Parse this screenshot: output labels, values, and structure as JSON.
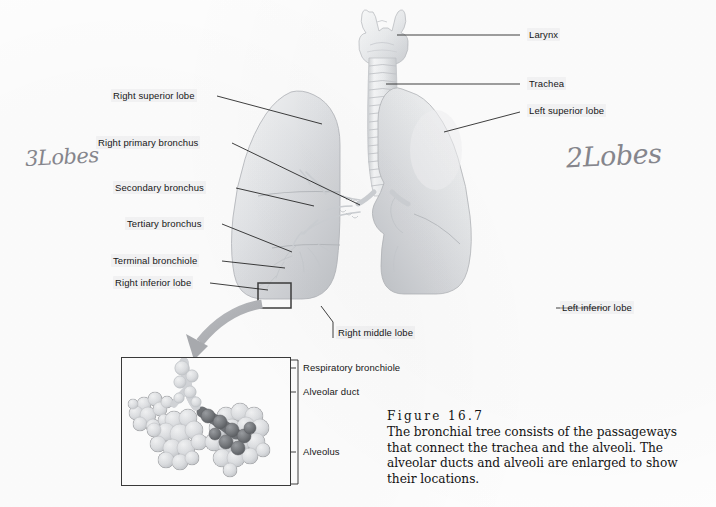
{
  "figure": {
    "number_label": "Figure 16.7",
    "caption": "The bronchial tree consists of the passageways that connect the trachea and the alveoli. The alveolar ducts and alveoli are enlarged to show their locations."
  },
  "labels_left": [
    {
      "name": "right-superior-lobe",
      "text": "Right superior lobe"
    },
    {
      "name": "right-primary-bronchus",
      "text": "Right primary bronchus"
    },
    {
      "name": "secondary-bronchus",
      "text": "Secondary bronchus"
    },
    {
      "name": "tertiary-bronchus",
      "text": "Tertiary bronchus"
    },
    {
      "name": "terminal-bronchiole",
      "text": "Terminal bronchiole"
    },
    {
      "name": "right-inferior-lobe",
      "text": "Right inferior lobe"
    }
  ],
  "labels_right": [
    {
      "name": "larynx",
      "text": "Larynx"
    },
    {
      "name": "trachea",
      "text": "Trachea"
    },
    {
      "name": "left-superior-lobe",
      "text": "Left superior lobe"
    },
    {
      "name": "left-inferior-lobe",
      "text": "Left inferior lobe"
    }
  ],
  "labels_other": [
    {
      "name": "right-middle-lobe",
      "text": "Right middle lobe"
    }
  ],
  "labels_inset": [
    {
      "name": "respiratory-bronchiole",
      "text": "Respiratory bronchiole"
    },
    {
      "name": "alveolar-duct",
      "text": "Alveolar duct"
    },
    {
      "name": "alveolus",
      "text": "Alveolus"
    }
  ],
  "annotations": [
    {
      "name": "handwriting-three-lobes",
      "text": "3Lobes"
    },
    {
      "name": "handwriting-two-lobes",
      "text": "2Lobes"
    }
  ],
  "colors": {
    "page_background": "#fdfdfd",
    "label_text": "#171717",
    "leader_line": "#1d1d1d",
    "handwriting": "#6e6e76",
    "lung_light": "#e9eaec",
    "lung_mid": "#d2d4d7",
    "lung_shadow": "#b9bcc0",
    "trachea": "#eef0f1",
    "arrow": "#b0b2b6",
    "alveoli_light": "#dcdee1",
    "alveoli_dark": "#6f7276",
    "inset_border": "#3a3a3a"
  }
}
